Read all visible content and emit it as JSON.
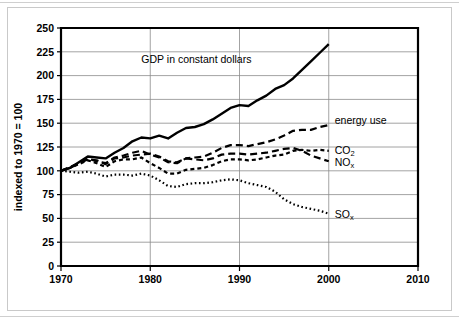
{
  "chart_data": {
    "type": "line",
    "title": "",
    "xlabel": "",
    "ylabel": "indexed to 1970 = 100",
    "xlim": [
      1970,
      2010
    ],
    "ylim": [
      0,
      250
    ],
    "xticks": [
      "1970",
      "1980",
      "1990",
      "2000",
      "2010"
    ],
    "yticks": [
      "0",
      "25",
      "50",
      "75",
      "100",
      "125",
      "150",
      "175",
      "200",
      "225",
      "250"
    ],
    "grid": true,
    "legend_position": "inline-right-of-line-ends",
    "annotations": [
      {
        "text": "GDP in constant dollars",
        "x": 1979,
        "y": 213
      }
    ],
    "x": [
      1970,
      1971,
      1972,
      1973,
      1974,
      1975,
      1976,
      1977,
      1978,
      1979,
      1980,
      1981,
      1982,
      1983,
      1984,
      1985,
      1986,
      1987,
      1988,
      1989,
      1990,
      1991,
      1992,
      1993,
      1994,
      1995,
      1996,
      1997,
      1998,
      1999,
      2000
    ],
    "series": [
      {
        "name": "GDP in constant dollars",
        "label": "GDP in constant dollars",
        "style": "solid",
        "color": "#000000",
        "values": [
          100,
          103,
          109,
          115,
          114,
          113,
          119,
          124,
          131,
          135,
          134,
          137,
          134,
          140,
          145,
          146,
          149,
          154,
          160,
          166,
          169,
          168,
          174,
          179,
          186,
          190,
          197,
          206,
          215,
          224,
          233
        ]
      },
      {
        "name": "energy use",
        "label": "energy use",
        "style": "dashed",
        "color": "#000000",
        "values": [
          100,
          103,
          108,
          113,
          110,
          108,
          114,
          116,
          119,
          121,
          117,
          114,
          109,
          108,
          113,
          114,
          115,
          119,
          124,
          127,
          127,
          126,
          128,
          130,
          133,
          137,
          142,
          143,
          143,
          146,
          148
        ]
      },
      {
        "name": "CO2",
        "label": "CO",
        "label_sub": "2",
        "style": "dashed-fine",
        "color": "#000000",
        "values": [
          100,
          103,
          107,
          111,
          108,
          104,
          110,
          112,
          112,
          114,
          108,
          103,
          97,
          97,
          101,
          102,
          103,
          106,
          110,
          112,
          112,
          111,
          112,
          114,
          116,
          117,
          121,
          122,
          121,
          122,
          121
        ]
      },
      {
        "name": "NOx",
        "label": "NO",
        "label_sub": "x",
        "style": "dashed",
        "color": "#000000",
        "values": [
          100,
          104,
          108,
          112,
          111,
          107,
          113,
          114,
          116,
          117,
          118,
          115,
          110,
          109,
          113,
          112,
          111,
          113,
          117,
          118,
          118,
          117,
          118,
          119,
          121,
          123,
          124,
          121,
          116,
          113,
          110
        ]
      },
      {
        "name": "SOx",
        "label": "SO",
        "label_sub": "x",
        "style": "dotted",
        "color": "#000000",
        "values": [
          100,
          99,
          98,
          99,
          97,
          94,
          96,
          96,
          95,
          97,
          95,
          90,
          84,
          83,
          86,
          87,
          87,
          88,
          90,
          91,
          90,
          87,
          85,
          83,
          78,
          70,
          65,
          62,
          60,
          58,
          55
        ]
      }
    ]
  },
  "labels": {
    "gdp_annotation": "GDP in constant dollars",
    "energy_use": "energy use",
    "co2_base": "CO",
    "co2_sub": "2",
    "nox_base": "NO",
    "nox_sub": "x",
    "sox_base": "SO",
    "sox_sub": "x",
    "y_axis_title": "indexed to 1970 = 100"
  }
}
